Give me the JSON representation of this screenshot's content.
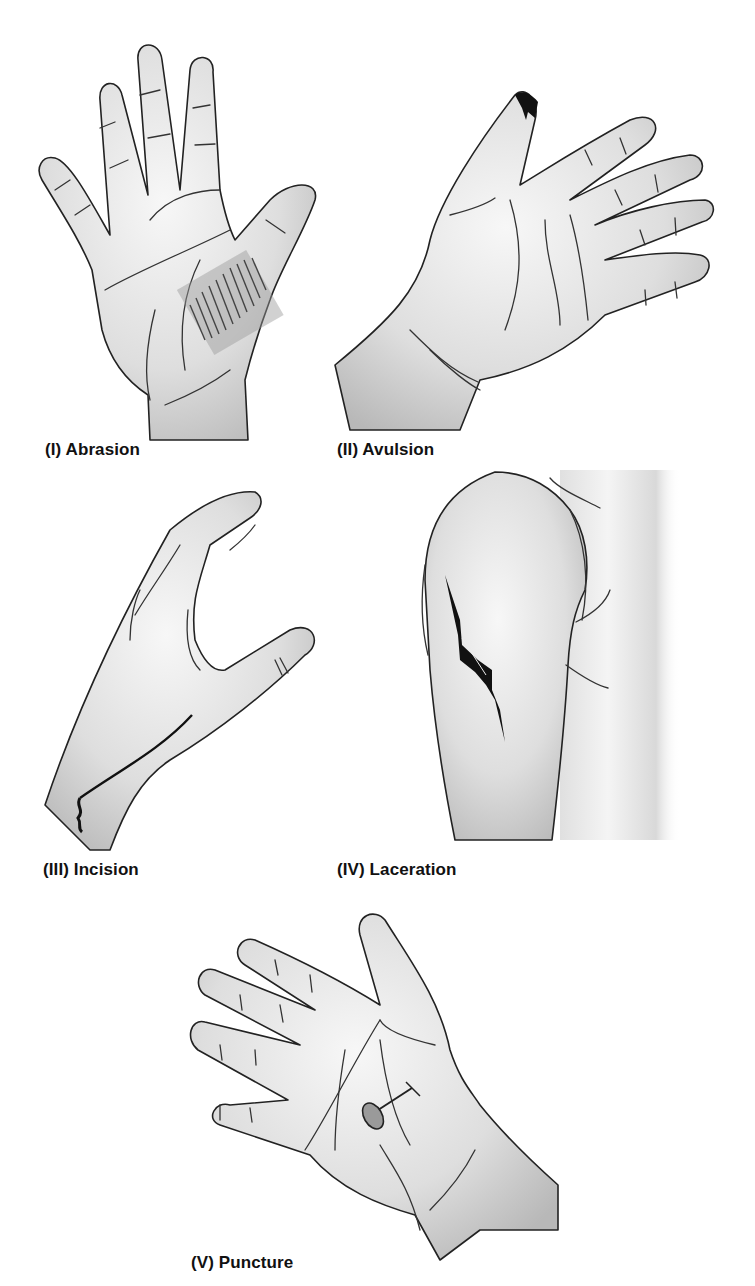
{
  "figure": {
    "title_fragment": "",
    "panels": [
      {
        "id": "I",
        "label": "(I) Abrasion",
        "depiction": "open palm with abrasion scrape marks near thumb base"
      },
      {
        "id": "II",
        "label": "(II) Avulsion",
        "depiction": "hand with torn tissue at thumb tip"
      },
      {
        "id": "III",
        "label": "(III) Incision",
        "depiction": "side view of hand with clean cut on wrist"
      },
      {
        "id": "IV",
        "label": "(IV) Laceration",
        "depiction": "upper arm / shoulder with jagged tear"
      },
      {
        "id": "V",
        "label": "(V) Puncture",
        "depiction": "palm with nail puncturing the skin"
      }
    ]
  },
  "colors": {
    "ink": "#222222",
    "wound": "#111111",
    "skin_light": "#f4f4f4",
    "skin_shadow": "#bdbdbd",
    "background": "#ffffff"
  }
}
